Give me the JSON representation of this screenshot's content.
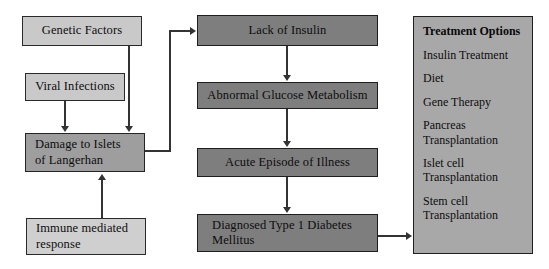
{
  "diagram": {
    "colors": {
      "background": "#ffffff",
      "light_box": "#c9c9c9",
      "light_soft_box": "#cfcfcf",
      "mid_box": "#9e9e9e",
      "dark_box": "#7e7e7e",
      "panel": "#a8a8a8",
      "line": "#333333",
      "border": "#222222",
      "text": "#0d0d0d"
    },
    "causes": [
      {
        "id": "genetic-factors",
        "label": "Genetic Factors"
      },
      {
        "id": "viral-infections",
        "label": "Viral Infections"
      },
      {
        "id": "damage-to-islets",
        "label": "Damage to Islets\nof Langerhan"
      },
      {
        "id": "immune-mediated-response",
        "label": "Immune mediated\nresponse"
      }
    ],
    "progression": [
      {
        "id": "lack-of-insulin",
        "label": "Lack of Insulin"
      },
      {
        "id": "abnormal-glucose-metabolism",
        "label": "Abnormal Glucose Metabolism"
      },
      {
        "id": "acute-episode-of-illness",
        "label": "Acute Episode of Illness"
      },
      {
        "id": "diagnosed-type-1-diabetes",
        "label": "Diagnosed Type 1 Diabetes\nMellitus"
      }
    ],
    "treatment_panel": {
      "title": "Treatment Options",
      "options": [
        {
          "id": "insulin-treatment",
          "label": "Insulin Treatment"
        },
        {
          "id": "diet",
          "label": "Diet"
        },
        {
          "id": "gene-therapy",
          "label": "Gene Therapy"
        },
        {
          "id": "pancreas-transplantation",
          "label": "Pancreas\nTransplantation"
        },
        {
          "id": "islet-cell-transplantation",
          "label": "Islet cell\nTransplantation"
        },
        {
          "id": "stem-cell-transplantation",
          "label": "Stem cell\nTransplantation"
        }
      ]
    }
  }
}
